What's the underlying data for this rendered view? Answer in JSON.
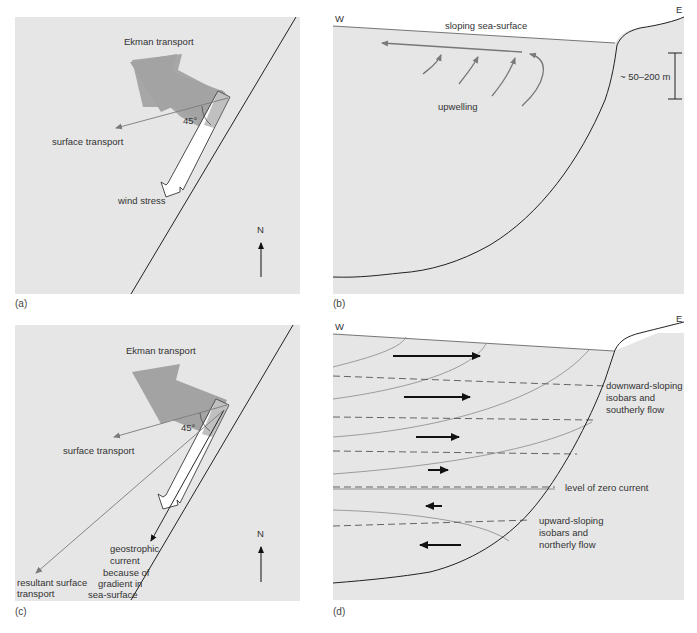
{
  "figure": {
    "panels": {
      "a": {
        "caption": "(a)",
        "labels": {
          "ekman": "Ekman transport",
          "surface": "surface transport",
          "angle": "45°",
          "wind": "wind stress",
          "north": "N"
        }
      },
      "b": {
        "caption": "(b)",
        "labels": {
          "west": "W",
          "east": "E",
          "sea_surface": "sloping sea-surface",
          "upwelling": "upwelling",
          "depth": "~ 50–200 m"
        }
      },
      "c": {
        "caption": "(c)",
        "labels": {
          "ekman": "Ekman transport",
          "surface": "surface transport",
          "angle": "45°",
          "north": "N",
          "resultant_1": "resultant surface",
          "resultant_2": "transport",
          "geo_1": "geostrophic",
          "geo_2": "current",
          "geo_3": "because of",
          "geo_4": "gradient in",
          "geo_5": "sea-surface"
        }
      },
      "d": {
        "caption": "(d)",
        "labels": {
          "west": "W",
          "east": "E",
          "down_1": "downward-sloping",
          "down_2": "isobars and",
          "down_3": "southerly flow",
          "zero": "level of zero current",
          "up_1": "upward-sloping",
          "up_2": "isobars and",
          "up_3": "northerly flow"
        }
      }
    },
    "colors": {
      "panel_bg": "#e6e6e6",
      "ekman_arrow": "#a3a3a3",
      "line": "#222222",
      "grey_line": "#777777"
    }
  }
}
